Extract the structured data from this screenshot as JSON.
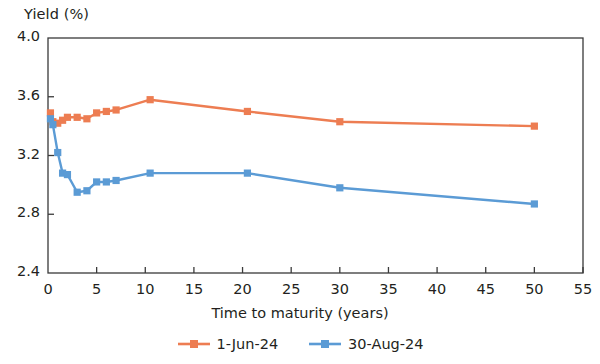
{
  "chart_data": {
    "type": "line",
    "title": "",
    "xlabel": "Time to maturity (years)",
    "ylabel": "Yield (%)",
    "xlim": [
      0,
      55
    ],
    "ylim": [
      2.4,
      4.0
    ],
    "xticks": [
      "0",
      "5",
      "10",
      "15",
      "20",
      "25",
      "30",
      "35",
      "40",
      "45",
      "50",
      "55"
    ],
    "yticks": [
      "2.4",
      "2.8",
      "3.2",
      "3.6",
      "4.0"
    ],
    "grid": false,
    "legend_position": "bottom-center",
    "marker": "square",
    "series": [
      {
        "name": "1-Jun-24",
        "color": "#ED7D52",
        "x": [
          0.25,
          0.5,
          1,
          1.5,
          2,
          3,
          4,
          5,
          6,
          7,
          10.5,
          20.5,
          30,
          50
        ],
        "values": [
          3.49,
          3.43,
          3.42,
          3.44,
          3.46,
          3.46,
          3.45,
          3.49,
          3.5,
          3.51,
          3.58,
          3.5,
          3.43,
          3.4
        ]
      },
      {
        "name": "30-Aug-24",
        "color": "#5B9BD5",
        "x": [
          0.25,
          0.5,
          1,
          1.5,
          2,
          3,
          4,
          5,
          6,
          7,
          10.5,
          20.5,
          30,
          50
        ],
        "values": [
          3.45,
          3.41,
          3.22,
          3.08,
          3.07,
          2.95,
          2.96,
          3.02,
          3.02,
          3.03,
          3.08,
          3.08,
          2.98,
          2.87
        ]
      }
    ]
  },
  "legend": {
    "entries": [
      {
        "label": "1-Jun-24"
      },
      {
        "label": "30-Aug-24"
      }
    ]
  }
}
